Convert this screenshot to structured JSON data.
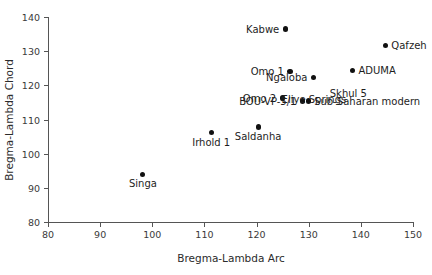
{
  "chart_data": {
    "type": "scatter",
    "title": "",
    "xlabel": "Bregma-Lambda Arc",
    "ylabel": "Bregma-Lambda Chord",
    "xlim": [
      80,
      150
    ],
    "ylim": [
      80,
      140
    ],
    "xticks": [
      80,
      90,
      100,
      110,
      120,
      130,
      140,
      150
    ],
    "yticks": [
      80,
      90,
      100,
      110,
      120,
      130,
      140
    ],
    "grid": false,
    "legend": "none",
    "marker_color": "#111111",
    "axis_color": "#555555",
    "points": [
      {
        "label": "Kabwe",
        "x": 125.5,
        "y": 136.5,
        "label_pos": "left"
      },
      {
        "label": "Qafzeh",
        "x": 144.7,
        "y": 131.7,
        "label_pos": "right"
      },
      {
        "label": "ADUMA",
        "x": 138.4,
        "y": 124.4,
        "label_pos": "right"
      },
      {
        "label": "Omo 1",
        "x": 126.4,
        "y": 124.1,
        "label_pos": "left"
      },
      {
        "label": "Ngaloba",
        "x": 130.9,
        "y": 122.4,
        "label_pos": "left"
      },
      {
        "label": "Omo 2",
        "x": 124.9,
        "y": 116.3,
        "label_pos": "left"
      },
      {
        "label": "BOU-VP-5/1",
        "x": 128.8,
        "y": 115.4,
        "label_pos": "left"
      },
      {
        "label": "Sub-Saharan modern",
        "x": 129.9,
        "y": 115.4,
        "label_pos": "right"
      },
      {
        "label": "Saldanha",
        "x": 120.3,
        "y": 107.8,
        "label_pos": "below"
      },
      {
        "label": "Irhold 1",
        "x": 111.3,
        "y": 106.1,
        "label_pos": "below"
      },
      {
        "label": "Singa",
        "x": 98.2,
        "y": 94.0,
        "label_pos": "below"
      }
    ],
    "floating_labels": [
      {
        "text": "Skhul 5",
        "x": 137.6,
        "y": 120.3
      },
      {
        "text": "Eliye Springs",
        "x": 131.0,
        "y": 118.5
      }
    ]
  }
}
